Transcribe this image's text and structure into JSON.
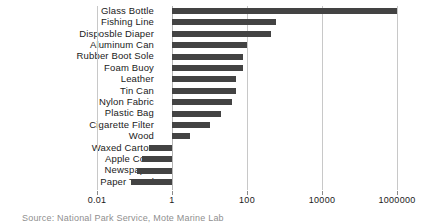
{
  "chart_data": {
    "type": "bar",
    "orientation": "horizontal",
    "title": "",
    "xlabel": "",
    "ylabel": "",
    "xscale": "log",
    "xlim": [
      0.01,
      1000000
    ],
    "xticks": [
      "0.01",
      "1",
      "100",
      "10000",
      "1000000"
    ],
    "xtick_values": [
      0.01,
      1,
      100,
      10000,
      1000000
    ],
    "grid": true,
    "legend": null,
    "bar_color": "#434343",
    "gridline_color": "#c8c8c8",
    "baseline_value": 1,
    "categories": [
      "Glass Bottle",
      "Fishing Line",
      "Disposble Diaper",
      "Aluminum Can",
      "Rubber Boot Sole",
      "Foam Buoy",
      "Leather",
      "Tin Can",
      "Nylon Fabric",
      "Plastic Bag",
      "Cigarette Filter",
      "Wood",
      "Waxed Carton",
      "Apple Core",
      "Newspaper",
      "Paper Towel"
    ],
    "values": [
      1000000,
      600,
      450,
      100,
      80,
      80,
      50,
      50,
      40,
      20,
      10,
      3,
      0.25,
      0.16,
      0.12,
      0.08
    ],
    "annotation": "Source: National Park Service, Mote Marine Lab"
  }
}
